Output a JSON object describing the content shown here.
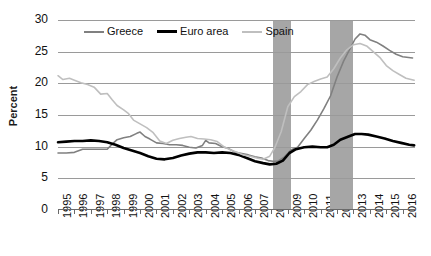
{
  "chart_data": {
    "type": "line",
    "title": "",
    "xlabel": "",
    "ylabel": "Percent",
    "ylim": [
      0,
      30
    ],
    "ytick_values": [
      30,
      25,
      20,
      15,
      10,
      5,
      0
    ],
    "xlim": [
      1995,
      2016.75
    ],
    "xtick_labels": [
      "1995",
      "1996",
      "1997",
      "1998",
      "1999",
      "2000",
      "2001",
      "2002",
      "2003",
      "2004",
      "2005",
      "2006",
      "2007",
      "2008",
      "2009",
      "2010",
      "2011",
      "2012",
      "2013",
      "2014",
      "2015",
      "2016"
    ],
    "grid": true,
    "legend_position": "top-left-inside",
    "legend": [
      "Greece",
      "Euro area",
      "Spain"
    ],
    "shaded_regions": [
      {
        "label": "recession-band-1",
        "x_start": 2008.1,
        "x_end": 2009.2,
        "color": "#a6a6a6"
      },
      {
        "label": "recession-band-2",
        "x_start": 2011.6,
        "x_end": 2013.0,
        "color": "#a6a6a6"
      }
    ],
    "series": [
      {
        "name": "Greece",
        "color": "#808080",
        "width": 1.6,
        "x": [
          1995.0,
          1995.5,
          1996.0,
          1996.5,
          1997.0,
          1997.5,
          1998.0,
          1998.3,
          1998.6,
          1999.0,
          1999.4,
          1999.8,
          2000.0,
          2000.3,
          2000.6,
          2001.0,
          2001.4,
          2001.8,
          2002.2,
          2002.6,
          2003.0,
          2003.4,
          2003.8,
          2004.0,
          2004.2,
          2004.6,
          2005.0,
          2005.4,
          2005.8,
          2006.2,
          2006.6,
          2007.0,
          2007.4,
          2007.8,
          2008.1,
          2008.4,
          2008.8,
          2009.2,
          2009.6,
          2010.0,
          2010.4,
          2010.8,
          2011.2,
          2011.6,
          2012.0,
          2012.4,
          2012.8,
          2013.1,
          2013.4,
          2013.7,
          2014.0,
          2014.4,
          2014.8,
          2015.2,
          2015.6,
          2016.0,
          2016.6
        ],
        "y": [
          9.0,
          9.0,
          9.1,
          9.6,
          9.6,
          9.6,
          9.6,
          10.4,
          11.1,
          11.4,
          11.6,
          12.1,
          12.3,
          11.6,
          11.2,
          10.6,
          10.5,
          10.3,
          10.3,
          10.2,
          9.9,
          9.8,
          10.2,
          11.0,
          10.6,
          10.5,
          10.0,
          9.7,
          9.1,
          8.9,
          8.7,
          8.4,
          8.2,
          7.8,
          7.7,
          7.7,
          8.4,
          9.5,
          9.9,
          11.3,
          12.6,
          14.2,
          16.0,
          18.0,
          21.0,
          23.5,
          25.5,
          27.0,
          27.8,
          27.6,
          26.9,
          26.5,
          25.9,
          25.2,
          24.6,
          24.2,
          24.0
        ]
      },
      {
        "name": "Euro area",
        "color": "#000000",
        "width": 2.6,
        "x": [
          1995.0,
          1995.5,
          1996.0,
          1996.5,
          1997.0,
          1997.5,
          1998.0,
          1998.5,
          1999.0,
          1999.5,
          2000.0,
          2000.5,
          2001.0,
          2001.5,
          2002.0,
          2002.5,
          2003.0,
          2003.5,
          2004.0,
          2004.5,
          2005.0,
          2005.5,
          2006.0,
          2006.5,
          2007.0,
          2007.5,
          2007.9,
          2008.3,
          2008.7,
          2009.1,
          2009.5,
          2010.0,
          2010.5,
          2011.0,
          2011.4,
          2011.8,
          2012.2,
          2012.7,
          2013.1,
          2013.5,
          2013.9,
          2014.4,
          2014.9,
          2015.4,
          2015.9,
          2016.4,
          2016.7
        ],
        "y": [
          10.7,
          10.8,
          10.9,
          10.9,
          11.0,
          10.9,
          10.7,
          10.3,
          9.8,
          9.4,
          9.0,
          8.5,
          8.1,
          8.0,
          8.2,
          8.6,
          8.9,
          9.1,
          9.1,
          9.0,
          9.1,
          9.0,
          8.7,
          8.2,
          7.7,
          7.4,
          7.2,
          7.3,
          7.8,
          9.0,
          9.6,
          9.9,
          10.0,
          9.9,
          9.9,
          10.3,
          11.1,
          11.6,
          12.0,
          12.0,
          11.9,
          11.6,
          11.3,
          10.9,
          10.6,
          10.3,
          10.2
        ]
      },
      {
        "name": "Spain",
        "color": "#bfbfbf",
        "width": 1.6,
        "x": [
          1995.0,
          1995.3,
          1995.7,
          1996.0,
          1996.4,
          1996.8,
          1997.2,
          1997.6,
          1998.0,
          1998.3,
          1998.6,
          1999.0,
          1999.3,
          1999.6,
          2000.0,
          2000.4,
          2000.8,
          2001.2,
          2001.6,
          2002.0,
          2002.4,
          2002.8,
          2003.1,
          2003.5,
          2003.9,
          2004.3,
          2004.7,
          2005.1,
          2005.5,
          2005.9,
          2006.3,
          2006.7,
          2007.1,
          2007.5,
          2007.9,
          2008.2,
          2008.6,
          2009.0,
          2009.4,
          2009.8,
          2010.2,
          2010.6,
          2011.0,
          2011.4,
          2011.8,
          2012.2,
          2012.6,
          2013.0,
          2013.4,
          2013.8,
          2014.2,
          2014.6,
          2015.0,
          2015.4,
          2015.8,
          2016.2,
          2016.7
        ],
        "y": [
          21.2,
          20.6,
          20.8,
          20.5,
          20.1,
          19.8,
          19.4,
          18.3,
          18.4,
          17.4,
          16.5,
          15.8,
          15.2,
          14.2,
          13.6,
          13.0,
          12.2,
          10.9,
          10.5,
          11.0,
          11.3,
          11.5,
          11.6,
          11.3,
          11.2,
          11.1,
          10.8,
          10.0,
          9.5,
          9.1,
          8.7,
          8.5,
          8.2,
          8.0,
          8.5,
          9.8,
          12.4,
          16.3,
          17.9,
          18.7,
          19.8,
          20.3,
          20.7,
          21.0,
          22.3,
          24.0,
          25.3,
          26.1,
          26.3,
          25.9,
          25.0,
          24.1,
          22.8,
          22.0,
          21.4,
          20.8,
          20.5
        ]
      }
    ]
  }
}
